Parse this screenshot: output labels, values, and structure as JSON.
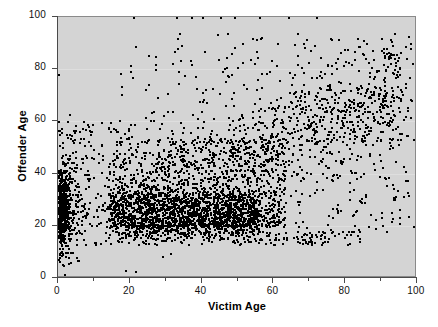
{
  "chart_data": {
    "type": "scatter",
    "title": "",
    "xlabel": "Victim Age",
    "ylabel": "Offender Age",
    "xlim": [
      0,
      100
    ],
    "ylim": [
      0,
      100
    ],
    "xticks": [
      0,
      20,
      40,
      60,
      80,
      100
    ],
    "xticklabels": [
      "0",
      "20",
      "40",
      "60",
      "80",
      "100"
    ],
    "xminorticks": [
      10,
      30,
      50,
      70,
      90
    ],
    "yticks": [
      0,
      20,
      40,
      60,
      80,
      100
    ],
    "yticklabels": [
      "0",
      "20",
      "40",
      "60",
      "80",
      "100"
    ],
    "grid": true,
    "gridlines_y": [
      20,
      40,
      60,
      80
    ],
    "legend": null,
    "marker": "square",
    "marker_color": "#000000",
    "marker_size_px": 2,
    "plot_background": "#d4d4d4",
    "page_background": "#ffffff",
    "n_points_approx": 4000,
    "clusters": [
      {
        "name": "infant-victim-spike",
        "x_range": [
          0,
          3
        ],
        "y_range": [
          16,
          48
        ],
        "weight": 420,
        "spread": "vertical"
      },
      {
        "name": "core-dense-block",
        "x_range": [
          14,
          56
        ],
        "y_range": [
          17,
          33
        ],
        "weight": 1250,
        "spread": "saturated"
      },
      {
        "name": "main-cloud",
        "x_range": [
          13,
          62
        ],
        "y_range": [
          18,
          52
        ],
        "weight": 1150,
        "spread": "dense"
      },
      {
        "name": "diagonal-trend",
        "x_range": [
          20,
          95
        ],
        "y_range": [
          25,
          92
        ],
        "weight": 640,
        "spread": "diagonal"
      },
      {
        "name": "upper-scatter",
        "x_range": [
          18,
          99
        ],
        "y_range": [
          55,
          95
        ],
        "weight": 300,
        "spread": "sparse"
      },
      {
        "name": "young-offender-tail",
        "x_range": [
          0,
          20
        ],
        "y_range": [
          18,
          60
        ],
        "weight": 240,
        "spread": "sparse"
      }
    ],
    "ceiling_points_y100_x": [
      21,
      33,
      37,
      40,
      45,
      49,
      56,
      64,
      72
    ],
    "notable_extremes": [
      {
        "x": 0,
        "y": 78
      },
      {
        "x": 0,
        "y": 60
      },
      {
        "x": 3,
        "y": 63
      },
      {
        "x": 7,
        "y": 60
      },
      {
        "x": 2,
        "y": 10
      },
      {
        "x": 5,
        "y": 13
      },
      {
        "x": 98,
        "y": 88
      },
      {
        "x": 90,
        "y": 92
      },
      {
        "x": 85,
        "y": 86
      },
      {
        "x": 96,
        "y": 43
      },
      {
        "x": 93,
        "y": 23
      },
      {
        "x": 99,
        "y": 20
      }
    ]
  }
}
